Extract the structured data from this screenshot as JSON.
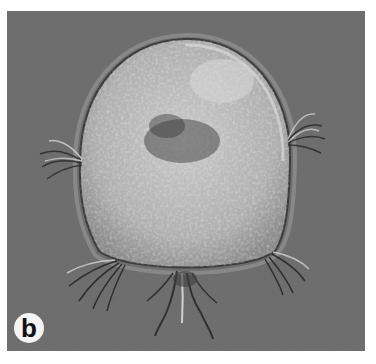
{
  "figure": {
    "panel_label": "b",
    "colors": {
      "background": "#6a6a6a",
      "cell_body": "#b8b8b8",
      "label_circle": "#f4f4f4",
      "label_text": "#111111"
    }
  }
}
